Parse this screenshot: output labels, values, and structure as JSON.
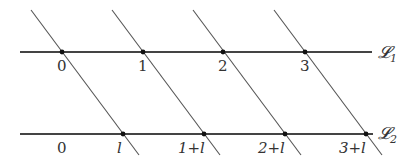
{
  "diagram": {
    "lines": {
      "L1": {
        "name": "𝓛",
        "subscript": "1",
        "y": 52,
        "x_start": 20,
        "x_end": 372
      },
      "L2": {
        "name": "𝓛",
        "subscript": "2",
        "y": 134,
        "x_start": 20,
        "x_end": 373
      }
    },
    "L1_points": [
      {
        "label": "0",
        "x": 62
      },
      {
        "label": "1",
        "x": 143
      },
      {
        "label": "2",
        "x": 223
      },
      {
        "label": "3",
        "x": 305
      }
    ],
    "L2_points": [
      {
        "label": "0",
        "x": 62,
        "dot": false
      },
      {
        "label": "l",
        "x": 123,
        "dot": true
      },
      {
        "label": "1+l",
        "x": 204,
        "dot": true
      },
      {
        "label": "2+l",
        "x": 285,
        "dot": true
      },
      {
        "label": "3+l",
        "x": 366,
        "dot": true
      }
    ],
    "parallel_lines_count": 4,
    "colors": {
      "line": "#444444",
      "slant": "#555555",
      "dot": "#111111",
      "text": "#333333"
    }
  }
}
